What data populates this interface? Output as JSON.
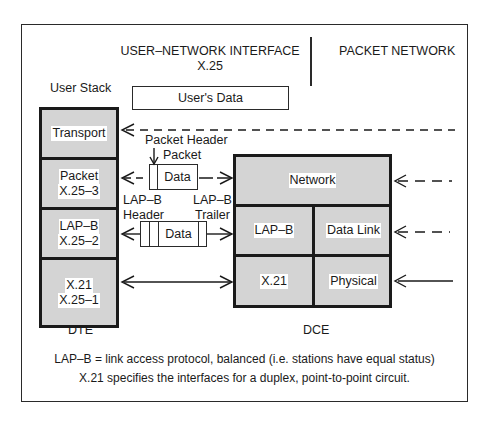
{
  "header": {
    "left_title": "USER–NETWORK INTERFACE",
    "left_subtitle": "X.25",
    "right_title": "PACKET NETWORK"
  },
  "user_stack": {
    "title": "User Stack",
    "layers": [
      {
        "line1": "Transport",
        "line2": ""
      },
      {
        "line1": "Packet",
        "line2": "X.25–3"
      },
      {
        "line1": "LAP–B",
        "line2": "X.25–2"
      },
      {
        "line1": "X.21",
        "line2": "X.25–1"
      }
    ],
    "footer": "DTE"
  },
  "users_data": "User's Data",
  "packet": {
    "header_label": "Packet Header",
    "packet_label": "Packet",
    "data_label": "Data"
  },
  "frame": {
    "header_label_line1": "LAP–B",
    "header_label_line2": "Header",
    "trailer_label_line1": "LAP–B",
    "trailer_label_line2": "Trailer",
    "data_label": "Data"
  },
  "dce_stack": {
    "network": "Network",
    "lapb": "LAP–B",
    "data_link": "Data Link",
    "x21": "X.21",
    "physical": "Physical",
    "footer": "DCE"
  },
  "notes": {
    "line1": "LAP–B = link access protocol, balanced (i.e. stations have equal status)",
    "line2": "X.21 specifies the interfaces for a duplex, point-to-point circuit."
  },
  "colors": {
    "layer_fill": "#d4d4d4",
    "border": "#1a1a1a",
    "background": "#ffffff"
  }
}
